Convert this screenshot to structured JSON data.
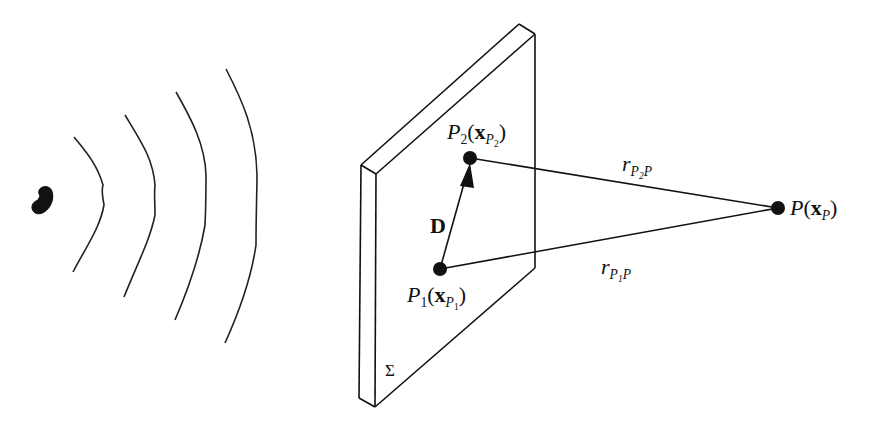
{
  "figure": {
    "colors": {
      "ink": "#111111",
      "background": "#ffffff"
    }
  },
  "labels": {
    "p2": {
      "name": "P",
      "sub": "2",
      "open": "(",
      "vec": "x",
      "vec_sub": "P",
      "vec_subsub": "2",
      "close": ")"
    },
    "p1": {
      "name": "P",
      "sub": "1",
      "open": "(",
      "vec": "x",
      "vec_sub": "P",
      "vec_subsub": "1",
      "close": ")"
    },
    "p": {
      "name": "P",
      "open": "(",
      "vec": "x",
      "vec_sub": "P",
      "close": ")"
    },
    "d": "D",
    "r_p2p": {
      "r": "r",
      "sub_a": "P",
      "sub_b": "2",
      "sub_c": "P"
    },
    "r_p1p": {
      "r": "r",
      "sub_a": "P",
      "sub_b": "1",
      "sub_c": "P"
    },
    "sigma": "Σ"
  }
}
